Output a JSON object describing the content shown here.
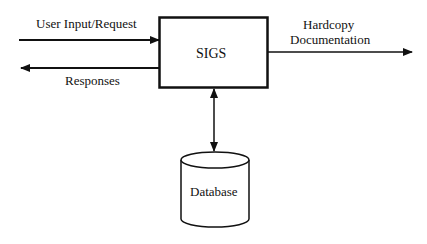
{
  "diagram": {
    "central_node": {
      "label": "SIGS"
    },
    "database_node": {
      "label": "Database"
    },
    "edges": [
      {
        "label": "User Input/Request",
        "direction": "in"
      },
      {
        "label": "Responses",
        "direction": "out"
      },
      {
        "label_line1": "Hardcopy",
        "label_line2": "Documentation",
        "direction": "out"
      },
      {
        "label": "",
        "direction": "bidirectional"
      }
    ],
    "colors": {
      "stroke": "#111111",
      "background": "#ffffff"
    }
  }
}
